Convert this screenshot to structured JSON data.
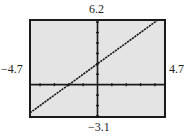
{
  "window": {
    "xmin": "-4.7",
    "xmax": "4.7",
    "ymin": "-3.1",
    "ymax": "6.2",
    "xscl": 1,
    "yscl": 1
  },
  "labels": {
    "ymax": "6.2",
    "ymin": "−3.1",
    "xmin": "−4.7",
    "xmax": "4.7"
  },
  "colors": {
    "screen_background": "#e4e4e4",
    "frame": "#1a1a1a",
    "axis": "#1a1a1a",
    "line": "#1a1a1a",
    "page_background": "#ffffff"
  },
  "chart_data": {
    "type": "line",
    "title": "",
    "xlabel": "",
    "ylabel": "",
    "xlim": [
      -4.7,
      4.7
    ],
    "ylim": [
      -3.1,
      6.2
    ],
    "grid": false,
    "legend": null,
    "tick_spacing": {
      "x": 1,
      "y": 1
    },
    "series": [
      {
        "name": "y = x + 2",
        "x": [
          -4.7,
          -2,
          0,
          4.2
        ],
        "y": [
          -2.7,
          0,
          2,
          6.2
        ]
      }
    ],
    "annotations": [
      "6.2",
      "−3.1",
      "−4.7",
      "4.7"
    ]
  }
}
